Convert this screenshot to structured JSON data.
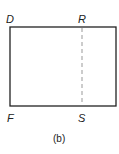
{
  "diagram": {
    "labels": {
      "top_left": "D",
      "top_mid": "R",
      "bottom_left": "F",
      "bottom_mid": "S"
    },
    "caption": "(b)",
    "colors": {
      "outline": "#222222",
      "dashed_line": "#999999"
    }
  }
}
